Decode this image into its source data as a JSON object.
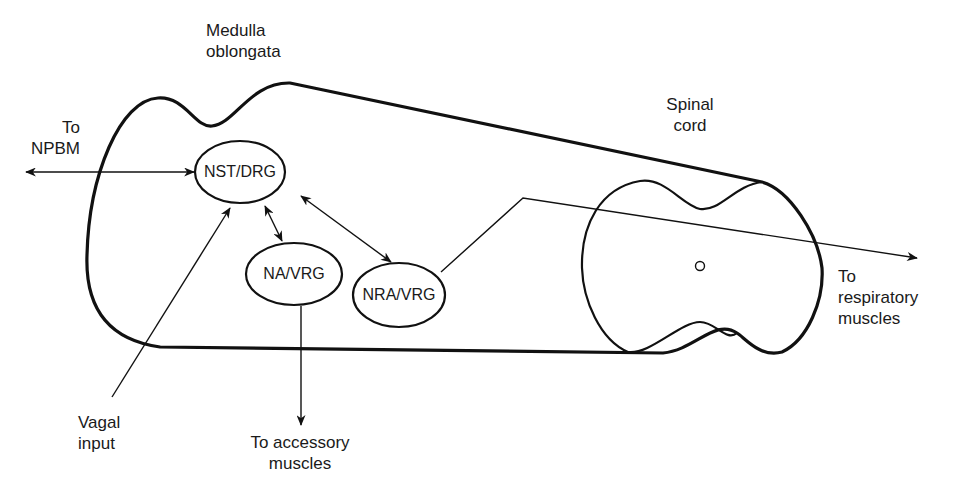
{
  "figure": {
    "regions": {
      "medulla": {
        "line1": "Medulla",
        "line2": "oblongata"
      },
      "spinal_cord": {
        "line1": "Spinal",
        "line2": "cord"
      }
    },
    "nodes": [
      {
        "id": "nst-drg",
        "label": "NST/DRG"
      },
      {
        "id": "na-vrg",
        "label": "NA/VRG"
      },
      {
        "id": "nra-vrg",
        "label": "NRA/VRG"
      }
    ],
    "external_labels": {
      "npbm": {
        "line1": "To",
        "line2": "NPBM"
      },
      "vagal": {
        "line1": "Vagal",
        "line2": "input"
      },
      "accessory": {
        "line1": "To accessory",
        "line2": "muscles"
      },
      "respiratory": {
        "line1": "To",
        "line2": "respiratory",
        "line3": "muscles"
      }
    },
    "connections": [
      {
        "from": "nst-drg",
        "to": "To NPBM",
        "type": "bidirectional"
      },
      {
        "from": "Vagal input",
        "to": "nst-drg",
        "type": "directed"
      },
      {
        "from": "nst-drg",
        "to": "na-vrg",
        "type": "bidirectional"
      },
      {
        "from": "nst-drg",
        "to": "nra-vrg",
        "type": "bidirectional"
      },
      {
        "from": "na-vrg",
        "to": "To accessory muscles",
        "type": "directed"
      },
      {
        "from": "nra-vrg",
        "to": "To respiratory muscles",
        "type": "directed"
      }
    ],
    "caption": {
      "note": "",
      "text": ""
    }
  }
}
